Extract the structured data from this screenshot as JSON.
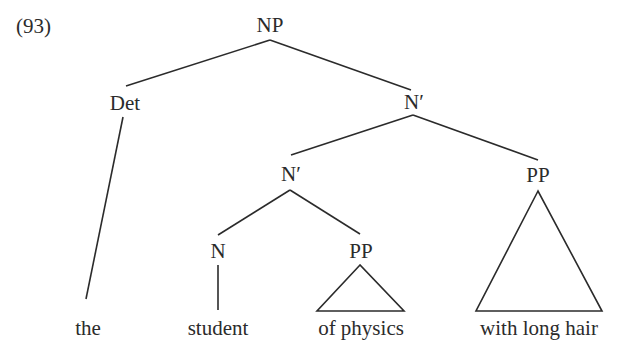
{
  "example_number": "(93)",
  "tree": {
    "root": "NP",
    "nodes": {
      "np": "NP",
      "det": "Det",
      "nbar_top": "N′",
      "nbar_low": "N′",
      "pp_right": "PP",
      "n": "N",
      "pp_mid": "PP"
    },
    "terminals": {
      "the": "the",
      "student": "student",
      "of_physics": "of physics",
      "with_long_hair": "with long hair"
    },
    "structure": "[NP [Det the] [N′ [N′ [N student] [PP of physics]] [PP with long hair]]]",
    "line_color": "#2b2b2b"
  }
}
